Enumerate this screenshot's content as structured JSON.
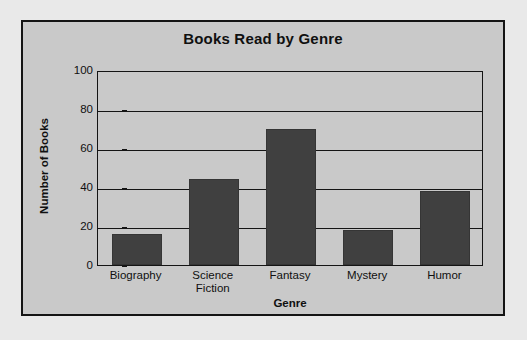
{
  "chart_data": {
    "type": "bar",
    "title": "Books Read by Genre",
    "xlabel": "Genre",
    "ylabel": "Number of Books",
    "categories": [
      "Biography",
      "Science Fiction",
      "Fantasy",
      "Mystery",
      "Humor"
    ],
    "category_lines": [
      [
        "Biography"
      ],
      [
        "Science",
        "Fiction"
      ],
      [
        "Fantasy"
      ],
      [
        "Mystery"
      ],
      [
        "Humor"
      ]
    ],
    "values": [
      16,
      44,
      70,
      18,
      38
    ],
    "ylim": [
      0,
      100
    ],
    "yticks": [
      0,
      20,
      40,
      60,
      80,
      100
    ],
    "ytick_labels": [
      "0",
      "20",
      "40",
      "60",
      "80",
      "100"
    ],
    "grid": "horizontal",
    "legend": "none",
    "bar_color": "#404040",
    "plot_background": "#c9c9c9",
    "page_background": "#e9e9e9",
    "axis_color": "#141414"
  }
}
